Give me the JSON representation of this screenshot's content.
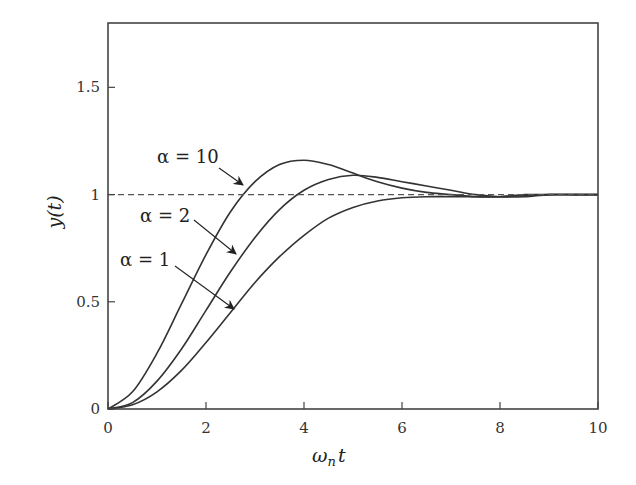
{
  "chart_data": {
    "type": "line",
    "title": "",
    "xlabel": "ω_n t",
    "ylabel": "y(t)",
    "xlim": [
      0,
      10
    ],
    "ylim": [
      0,
      1.8
    ],
    "grid": false,
    "legend": "none (inline arrow annotations)",
    "xticks": [
      0,
      2,
      4,
      6,
      8,
      10
    ],
    "xtick_labels": [
      "0",
      "2",
      "4",
      "6",
      "8",
      "10"
    ],
    "yticks": [
      0,
      0.5,
      1,
      1.5
    ],
    "ytick_labels": [
      "0",
      "0.5",
      "1",
      "1.5"
    ],
    "x": [
      0,
      0.5,
      1,
      1.5,
      2,
      2.5,
      3,
      3.5,
      4,
      4.5,
      5,
      5.5,
      6,
      6.5,
      7,
      7.5,
      8,
      8.5,
      9,
      9.5,
      10
    ],
    "series": [
      {
        "name": "α = 10",
        "style": "solid",
        "values": [
          0,
          0.08,
          0.26,
          0.49,
          0.72,
          0.92,
          1.06,
          1.14,
          1.16,
          1.14,
          1.1,
          1.06,
          1.03,
          1.01,
          1.0,
          0.99,
          0.99,
          1.0,
          1.0,
          1.0,
          1.0
        ]
      },
      {
        "name": "α = 2",
        "style": "solid",
        "values": [
          0,
          0.03,
          0.13,
          0.28,
          0.46,
          0.64,
          0.8,
          0.93,
          1.02,
          1.07,
          1.09,
          1.08,
          1.06,
          1.04,
          1.02,
          1.0,
          0.99,
          0.99,
          1.0,
          1.0,
          1.0
        ]
      },
      {
        "name": "α = 1",
        "style": "solid",
        "values": [
          0,
          0.02,
          0.08,
          0.18,
          0.31,
          0.45,
          0.59,
          0.71,
          0.81,
          0.89,
          0.94,
          0.97,
          0.985,
          0.99,
          0.99,
          0.99,
          0.99,
          0.995,
          1.0,
          1.0,
          1.0
        ]
      },
      {
        "name": "reference",
        "style": "dashed",
        "values": [
          1,
          1,
          1,
          1,
          1,
          1,
          1,
          1,
          1,
          1,
          1,
          1,
          1,
          1,
          1,
          1,
          1,
          1,
          1,
          1,
          1
        ]
      }
    ],
    "annotations": [
      {
        "text": "α = 10",
        "arrow_to": [
          2.7,
          1.0
        ]
      },
      {
        "text": "α = 2",
        "arrow_to": [
          2.6,
          0.72
        ]
      },
      {
        "text": "α = 1",
        "arrow_to": [
          2.6,
          0.45
        ]
      }
    ]
  },
  "labels": {
    "xlabel_main": "ω",
    "xlabel_sub": "n",
    "xlabel_tail": "t",
    "ylabel": "y(t)",
    "annot_10": "α = 10",
    "annot_2": "α = 2",
    "annot_1": "α = 1"
  },
  "colors": {
    "line": "#333333",
    "axis": "#444444",
    "dash": "#555555"
  }
}
